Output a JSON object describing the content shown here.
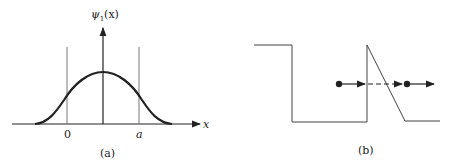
{
  "panel_a": {
    "caption": "(a)",
    "y_label_main": "ψ",
    "y_label_sub": "1",
    "y_label_arg": "(x)",
    "x_label": "x",
    "tick_left": "0",
    "tick_right": "a"
  },
  "panel_b": {
    "caption": "(b)"
  },
  "colors": {
    "ink": "#222222",
    "thin_line": "#555555"
  }
}
